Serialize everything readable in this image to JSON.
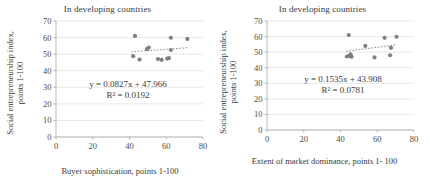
{
  "figure": {
    "panel_count": 2
  },
  "chart_data": [
    {
      "type": "scatter",
      "title": "In developing countries",
      "xlabel": "Buyer sophistication, points 1-100",
      "ylabel": "Social entrepreneurship index, points 1-100",
      "ylabel_line1": "Social entrepreneurship index,",
      "ylabel_line2": "points 1-100",
      "xlim": [
        0,
        80
      ],
      "ylim": [
        0,
        70
      ],
      "xticks": [
        0,
        20,
        40,
        60,
        80
      ],
      "yticks": [
        0,
        10,
        20,
        30,
        40,
        50,
        60,
        70
      ],
      "grid": true,
      "legend": "none",
      "marker_color": "#808080",
      "trendline_color": "#808080",
      "equation": "y = 0.0827x + 47.966",
      "r_squared": "R² = 0.0192",
      "trend_slope": 0.0827,
      "trend_intercept": 47.966,
      "trend_x_range": [
        41,
        72
      ],
      "points": [
        {
          "x": 42.0,
          "y": 48.8
        },
        {
          "x": 43.0,
          "y": 61.0
        },
        {
          "x": 45.5,
          "y": 46.7
        },
        {
          "x": 49.5,
          "y": 53.0
        },
        {
          "x": 50.5,
          "y": 54.0
        },
        {
          "x": 55.5,
          "y": 47.0
        },
        {
          "x": 57.5,
          "y": 46.6
        },
        {
          "x": 60.5,
          "y": 47.3
        },
        {
          "x": 61.5,
          "y": 47.6
        },
        {
          "x": 62.5,
          "y": 52.5
        },
        {
          "x": 62.5,
          "y": 59.9
        },
        {
          "x": 71.5,
          "y": 59.2
        }
      ]
    },
    {
      "type": "scatter",
      "title": "In developing countries",
      "xlabel": "Extent of market dominance, points 1-100",
      "xlabel_line1": "Extent of market dominance, points 1-",
      "xlabel_line2": "100",
      "ylabel": "Social entrepreneurship index, points 1-100",
      "ylabel_line1": "Social entrepreneurship index,",
      "ylabel_line2": "points 1-100",
      "xlim": [
        0,
        80
      ],
      "ylim": [
        0,
        70
      ],
      "xticks": [
        0,
        20,
        40,
        60,
        80
      ],
      "yticks": [
        0,
        10,
        20,
        30,
        40,
        50,
        60,
        70
      ],
      "grid": true,
      "legend": "none",
      "marker_color": "#808080",
      "trendline_color": "#808080",
      "equation": "y = 0.1535x + 43.908",
      "r_squared": "R² = 0.0781",
      "trend_slope": 0.1535,
      "trend_intercept": 43.908,
      "trend_x_range": [
        43,
        70
      ],
      "points": [
        {
          "x": 43.5,
          "y": 47.2
        },
        {
          "x": 44.5,
          "y": 61.0
        },
        {
          "x": 44.8,
          "y": 47.6
        },
        {
          "x": 45.5,
          "y": 48.6
        },
        {
          "x": 46.0,
          "y": 47.0
        },
        {
          "x": 53.5,
          "y": 54.0
        },
        {
          "x": 58.5,
          "y": 46.6
        },
        {
          "x": 64.0,
          "y": 59.2
        },
        {
          "x": 67.0,
          "y": 48.0
        },
        {
          "x": 67.5,
          "y": 52.8
        },
        {
          "x": 70.5,
          "y": 59.9
        }
      ]
    }
  ]
}
